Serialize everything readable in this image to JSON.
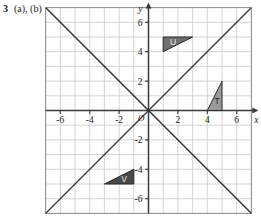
{
  "question": {
    "number": "3",
    "parts": "(a), (b)"
  },
  "chart_data": {
    "type": "scatter",
    "title": "",
    "xlabel": "x",
    "ylabel": "y",
    "xlim": [
      -7,
      7
    ],
    "ylim": [
      -7,
      7
    ],
    "grid": true,
    "grid_step": 1,
    "legend": "none",
    "x_ticks": [
      "-6",
      "-4",
      "-2",
      "2",
      "4",
      "6"
    ],
    "x_tick_values": [
      -6,
      -4,
      -2,
      2,
      4,
      6
    ],
    "y_ticks": [
      "6",
      "4",
      "2",
      "-2",
      "-4",
      "-6"
    ],
    "y_tick_values": [
      6,
      4,
      2,
      -2,
      -4,
      -6
    ],
    "origin_label": "O",
    "lines": [
      {
        "name": "y = x",
        "equation": "y = x",
        "slope": 1,
        "intercept": 0,
        "from": [
          -7,
          -7
        ],
        "to": [
          7,
          7
        ]
      },
      {
        "name": "y = -x",
        "equation": "y = -x",
        "slope": -1,
        "intercept": 0,
        "from": [
          -7,
          7
        ],
        "to": [
          7,
          -7
        ]
      }
    ],
    "shapes": [
      {
        "label": "U",
        "fill": "#6e6e6e",
        "label_color": "light",
        "vertices": [
          [
            1,
            5
          ],
          [
            3,
            5
          ],
          [
            1,
            4
          ]
        ]
      },
      {
        "label": "T",
        "fill": "#9a9a9a",
        "label_color": "dark",
        "vertices": [
          [
            5,
            2
          ],
          [
            5,
            0
          ],
          [
            4,
            0
          ]
        ]
      },
      {
        "label": "V",
        "fill": "#4a4a4a",
        "label_color": "light",
        "vertices": [
          [
            -3,
            -5
          ],
          [
            -1,
            -5
          ],
          [
            -1,
            -4
          ]
        ]
      }
    ]
  },
  "colors": {
    "grid_minor": "#c9c9c9",
    "grid_border": "#8e8e8e",
    "axis": "#3a3a3a",
    "line": "#333333",
    "shape_u": "#6e6e6e",
    "shape_t": "#9a9a9a",
    "shape_v": "#4a4a4a",
    "background": "#ffffff"
  }
}
